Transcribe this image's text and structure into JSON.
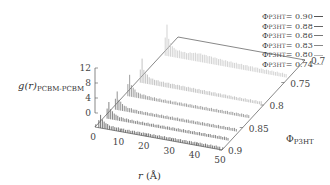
{
  "chart_data": {
    "type": "waterfall-3d",
    "title": "",
    "ylabel": "g(r)",
    "ylabel_subscript": "PCBM-PCBM",
    "xlabel": "r",
    "xlabel_unit": "(Å)",
    "zlabel": "Φ",
    "zlabel_subscript": "P3HT",
    "x_ticks": [
      "0",
      "10",
      "20",
      "30",
      "40",
      "50"
    ],
    "y_ticks": [
      "0",
      "4",
      "8",
      "12"
    ],
    "z_ticks": [
      "0.7",
      "0.75",
      "0.8",
      "0.85",
      "0.9"
    ],
    "xlim": [
      0,
      50
    ],
    "ylim": [
      0,
      12
    ],
    "zlim": [
      0.7,
      0.9
    ],
    "legend_position": "top-right",
    "series": [
      {
        "name": "ΦP3HT = 0.90",
        "phi": 0.9,
        "color": "#555555",
        "r": [
          1,
          2,
          3,
          4,
          5,
          6,
          8,
          10,
          12,
          15,
          20,
          25,
          30,
          35,
          40,
          45,
          50
        ],
        "g": [
          0,
          5.0,
          2.6,
          2.2,
          1.6,
          1.3,
          1.2,
          1.1,
          1.0,
          1.0,
          1.0,
          1.0,
          1.0,
          1.0,
          1.0,
          1.0,
          1.0
        ]
      },
      {
        "name": "ΦP3HT = 0.88",
        "phi": 0.88,
        "color": "#666666",
        "r": [
          1,
          2,
          3,
          4,
          5,
          6,
          8,
          10,
          12,
          15,
          20,
          25,
          30,
          35,
          40,
          45,
          50
        ],
        "g": [
          0,
          6.5,
          3.0,
          2.5,
          1.8,
          1.4,
          1.2,
          1.1,
          1.0,
          1.0,
          1.0,
          1.0,
          1.0,
          1.0,
          1.0,
          1.0,
          1.0
        ]
      },
      {
        "name": "ΦP3HT = 0.86",
        "phi": 0.86,
        "color": "#777777",
        "r": [
          1,
          2,
          3,
          4,
          5,
          6,
          8,
          10,
          12,
          15,
          20,
          25,
          30,
          35,
          40,
          45,
          50
        ],
        "g": [
          0,
          7.0,
          3.2,
          2.6,
          1.9,
          1.5,
          1.3,
          1.1,
          1.0,
          1.0,
          1.0,
          1.0,
          1.0,
          1.0,
          1.0,
          1.0,
          1.0
        ]
      },
      {
        "name": "ΦP3HT = 0.83",
        "phi": 0.83,
        "color": "#888888",
        "r": [
          1,
          2,
          3,
          4,
          5,
          6,
          8,
          10,
          12,
          15,
          20,
          25,
          30,
          35,
          40,
          45,
          50
        ],
        "g": [
          0,
          8.0,
          3.6,
          2.8,
          2.0,
          1.6,
          1.4,
          1.2,
          1.1,
          1.0,
          1.0,
          1.0,
          1.0,
          1.0,
          1.0,
          1.0,
          1.0
        ]
      },
      {
        "name": "ΦP3HT = 0.80",
        "phi": 0.8,
        "color": "#b5b5b5",
        "r": [
          1,
          2,
          3,
          4,
          5,
          6,
          8,
          10,
          12,
          15,
          20,
          25,
          30,
          35,
          40,
          45,
          50
        ],
        "g": [
          0,
          9.0,
          4.0,
          3.2,
          2.4,
          2.0,
          1.8,
          1.6,
          1.6,
          1.5,
          1.4,
          1.3,
          1.2,
          1.1,
          1.0,
          1.0,
          1.0
        ]
      },
      {
        "name": "ΦP3HT = 0.74",
        "phi": 0.74,
        "color": "#c8c8c8",
        "r": [
          1,
          2,
          3,
          4,
          5,
          6,
          8,
          10,
          12,
          15,
          20,
          25,
          30,
          35,
          40,
          45,
          50
        ],
        "g": [
          0,
          12.0,
          5.0,
          4.0,
          3.0,
          2.6,
          2.4,
          2.2,
          2.6,
          2.8,
          2.4,
          2.0,
          1.8,
          1.6,
          1.4,
          1.3,
          1.2
        ]
      }
    ]
  },
  "labels": {
    "y_axis_main": "g(r)",
    "y_axis_sub": "PCBM-PCBM",
    "x_axis_main": "r",
    "x_axis_unit": " (Å)",
    "z_axis_main": "Φ",
    "z_axis_sub": "P3HT",
    "legend_prefix": "Φ",
    "legend_sub": "P3HT"
  },
  "legend": [
    {
      "value": " = 0.90",
      "color": "#555555"
    },
    {
      "value": " = 0.88",
      "color": "#666666"
    },
    {
      "value": " = 0.86",
      "color": "#777777"
    },
    {
      "value": " = 0.83",
      "color": "#888888"
    },
    {
      "value": " = 0.80",
      "color": "#b5b5b5"
    },
    {
      "value": " = 0.74",
      "color": "#c8c8c8"
    }
  ]
}
